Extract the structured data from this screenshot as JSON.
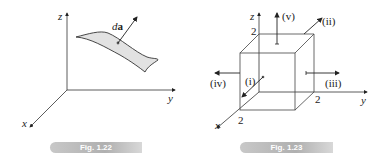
{
  "figures": [
    {
      "caption": "Fig. 1.22",
      "axes": {
        "x": "x",
        "y": "y",
        "z": "z"
      },
      "vector_label_prefix": "d",
      "vector_label_bold": "a"
    },
    {
      "caption": "Fig. 1.23",
      "axes": {
        "x": "x",
        "y": "y",
        "z": "z"
      },
      "tick_labels": {
        "z": "2",
        "y": "2",
        "x": "2"
      },
      "arrows": [
        "(i)",
        "(ii)",
        "(iii)",
        "(iv)",
        "(v)"
      ]
    }
  ],
  "colors": {
    "line": "#333333",
    "surface_fill": "#e2e2e2",
    "caption_bg": "#b8b8b8"
  }
}
